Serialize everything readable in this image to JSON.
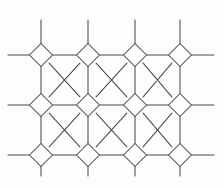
{
  "figure": {
    "background_color": "#fdfdfc",
    "line_color": "#4a4a4a",
    "line_width": 1.05,
    "canvas": {
      "width": 224,
      "height": 188
    }
  },
  "geometry": {
    "node_type": "diamond",
    "node_half_diagonal": 11.5,
    "column_centers_x": [
      41,
      88,
      135,
      180
    ],
    "row_centers_y": [
      55,
      105,
      155
    ],
    "column_spacing": 47,
    "row_spacing": 50,
    "stub_top_y": 20,
    "stub_bottom_y": 176,
    "stub_left_x": 8,
    "stub_right_x": 214
  },
  "chart_data": {
    "type": "diagram",
    "nodes": [
      {
        "id": "n-0-0",
        "col": 0,
        "row": 0,
        "cx": 41,
        "cy": 55
      },
      {
        "id": "n-1-0",
        "col": 1,
        "row": 0,
        "cx": 88,
        "cy": 55
      },
      {
        "id": "n-2-0",
        "col": 2,
        "row": 0,
        "cx": 135,
        "cy": 55
      },
      {
        "id": "n-3-0",
        "col": 3,
        "row": 0,
        "cx": 180,
        "cy": 55
      },
      {
        "id": "n-0-1",
        "col": 0,
        "row": 1,
        "cx": 41,
        "cy": 105
      },
      {
        "id": "n-1-1",
        "col": 1,
        "row": 1,
        "cx": 88,
        "cy": 105
      },
      {
        "id": "n-2-1",
        "col": 2,
        "row": 1,
        "cx": 135,
        "cy": 105
      },
      {
        "id": "n-3-1",
        "col": 3,
        "row": 1,
        "cx": 180,
        "cy": 105
      },
      {
        "id": "n-0-2",
        "col": 0,
        "row": 2,
        "cx": 41,
        "cy": 155
      },
      {
        "id": "n-1-2",
        "col": 1,
        "row": 2,
        "cx": 88,
        "cy": 155
      },
      {
        "id": "n-2-2",
        "col": 2,
        "row": 2,
        "cx": 135,
        "cy": 155
      },
      {
        "id": "n-3-2",
        "col": 3,
        "row": 2,
        "cx": 180,
        "cy": 155
      }
    ],
    "node_count": 12,
    "octagon_count": 6,
    "edge_angle_degrees": 45
  },
  "specks": [
    {
      "x": 196,
      "y": 10,
      "size": 2
    },
    {
      "x": 186,
      "y": 16,
      "size": 1
    },
    {
      "x": 84,
      "y": 8,
      "size": 2
    },
    {
      "x": 156,
      "y": 80,
      "size": 2
    },
    {
      "x": 163,
      "y": 66,
      "size": 1
    },
    {
      "x": 120,
      "y": 164,
      "size": 2
    },
    {
      "x": 60,
      "y": 178,
      "size": 1
    },
    {
      "x": 213,
      "y": 52,
      "size": 2
    }
  ]
}
